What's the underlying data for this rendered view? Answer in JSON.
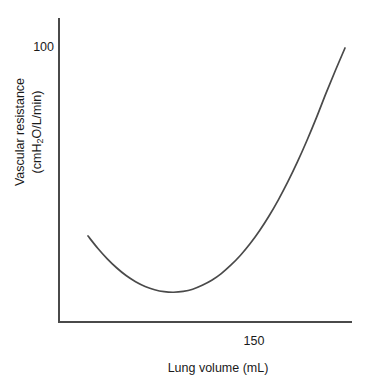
{
  "figure": {
    "background_color": "#ffffff",
    "axis_color": "#4a4a4a",
    "text_color": "#1a1a1a",
    "curve_color": "#4a4a4a"
  },
  "axes": {
    "y_title_line1": "Vascular resistance",
    "y_title_line2_prefix": "(cmH",
    "y_title_line2_sub": "2",
    "y_title_line2_suffix": "O/L/min)",
    "x_title": "Lung volume (mL)",
    "y_tick_label": "100",
    "x_tick_label": "150"
  },
  "chart_data": {
    "type": "line",
    "title": "",
    "subtitle": "",
    "xlabel": "Lung volume (mL)",
    "ylabel": "Vascular resistance (cmH2O/L/min)",
    "grid": false,
    "legend": false,
    "legend_position": "none",
    "xticks": [
      150
    ],
    "xticklabels": [
      "150"
    ],
    "yticks": [
      100
    ],
    "yticklabels": [
      "100"
    ],
    "xlim": [
      100,
      250
    ],
    "ylim": [
      0,
      115
    ],
    "annotations": [],
    "series": [
      {
        "name": "Pulmonary vascular resistance",
        "color": "#4a4a4a",
        "x": [
          115,
          120,
          125,
          130,
          135,
          140,
          145,
          150,
          155,
          160,
          165,
          170,
          175,
          180,
          185,
          190,
          195,
          200,
          205,
          210,
          215,
          220,
          225,
          230,
          235,
          240,
          245,
          250
        ],
        "y": [
          32.5,
          28.2,
          24.4,
          21.1,
          18.3,
          16.1,
          14.4,
          13.2,
          12.5,
          12.3,
          12.6,
          13.4,
          14.8,
          16.6,
          19.0,
          22.0,
          25.5,
          29.6,
          34.3,
          39.6,
          45.5,
          52.0,
          59.1,
          66.8,
          75.0,
          83.7,
          92.0,
          100.0
        ]
      }
    ],
    "curve_geometry_px": {
      "start": [
        88,
        236
      ],
      "minimum": [
        180,
        301
      ],
      "end": [
        345,
        48
      ],
      "plot_origin": [
        58,
        322
      ],
      "plot_right": [
        352,
        322
      ],
      "plot_top": [
        58,
        18
      ]
    }
  }
}
